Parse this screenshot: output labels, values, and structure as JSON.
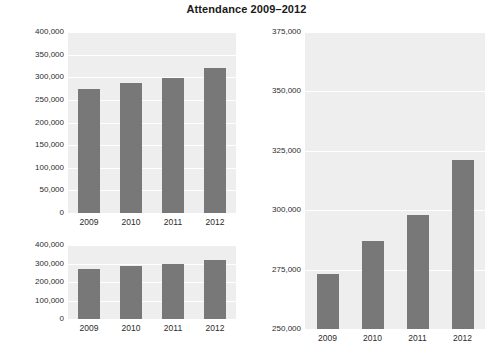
{
  "title": "Attendance 2009–2012",
  "colors": {
    "bar": "#787878",
    "plot_background": "#eeeeee",
    "gridline": "#ffffff",
    "text": "#2b2b2b",
    "page_background": "#ffffff"
  },
  "chart_data": [
    {
      "id": "top-left",
      "type": "bar",
      "title": "Attendance 2009–2012",
      "xlabel": "",
      "ylabel": "",
      "categories": [
        "2009",
        "2010",
        "2011",
        "2012"
      ],
      "values": [
        273000,
        287000,
        298000,
        321000
      ],
      "ylim": [
        0,
        400000
      ],
      "ytick_step": 50000,
      "ytick_labels": [
        "0",
        "50,000",
        "100,000",
        "150,000",
        "200,000",
        "250,000",
        "300,000",
        "350,000",
        "400,000"
      ],
      "ytick_values": [
        0,
        50000,
        100000,
        150000,
        200000,
        250000,
        300000,
        350000,
        400000
      ],
      "grid": true,
      "legend": "none",
      "bar_color": "#787878"
    },
    {
      "id": "bottom-left",
      "type": "bar",
      "title": "",
      "xlabel": "",
      "ylabel": "",
      "categories": [
        "2009",
        "2010",
        "2011",
        "2012"
      ],
      "values": [
        273000,
        287000,
        298000,
        321000
      ],
      "ylim": [
        0,
        400000
      ],
      "ytick_step": 100000,
      "ytick_labels": [
        "0",
        "100,000",
        "200,000",
        "300,000",
        "400,000"
      ],
      "ytick_values": [
        0,
        100000,
        200000,
        300000,
        400000
      ],
      "grid": true,
      "legend": "none",
      "bar_color": "#787878"
    },
    {
      "id": "right",
      "type": "bar",
      "title": "",
      "xlabel": "",
      "ylabel": "",
      "categories": [
        "2009",
        "2010",
        "2011",
        "2012"
      ],
      "values": [
        273000,
        287000,
        298000,
        321000
      ],
      "ylim": [
        250000,
        375000
      ],
      "ytick_step": 25000,
      "ytick_labels": [
        "250,000",
        "275,000",
        "300,000",
        "325,000",
        "350,000",
        "375,000"
      ],
      "ytick_values": [
        250000,
        275000,
        300000,
        325000,
        350000,
        375000
      ],
      "grid": true,
      "legend": "none",
      "bar_color": "#787878"
    }
  ]
}
